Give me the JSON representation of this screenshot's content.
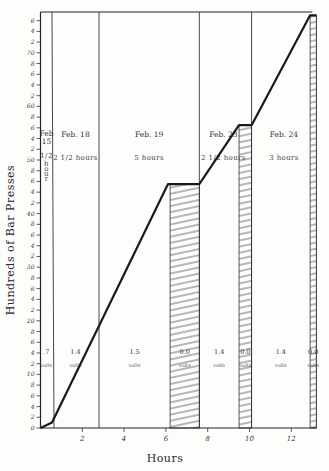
{
  "chart_data": {
    "type": "line",
    "title": "",
    "xlabel": "Hours",
    "ylabel": "Hundreds of Bar Presses",
    "xlim": [
      0,
      13.2
    ],
    "ylim": [
      0,
      78
    ],
    "x_ticks": [
      2,
      4,
      6,
      8,
      10,
      12
    ],
    "x_tick_labels": [
      "2",
      "4",
      "6",
      "8",
      "10",
      "12"
    ],
    "y_major_ticks": [
      0,
      10,
      20,
      30,
      40,
      50,
      60,
      70
    ],
    "y_major_labels": [
      "0",
      "10",
      "20",
      "30",
      "40",
      "50",
      "60",
      "70"
    ],
    "y_minor_step": 2,
    "y_minor_labels": [
      "2",
      "4",
      "6",
      "8"
    ],
    "grid": false,
    "series": [
      {
        "name": "Cumulative bar presses",
        "points": [
          [
            0,
            0
          ],
          [
            0.55,
            1
          ],
          [
            6.1,
            45.5
          ],
          [
            7.6,
            45.5
          ],
          [
            9.5,
            56.5
          ],
          [
            10.1,
            56.5
          ],
          [
            12.9,
            77
          ],
          [
            13.2,
            77
          ]
        ]
      }
    ],
    "sessions": [
      {
        "date": "Feb. 15",
        "duration": "1/2 hour",
        "start": 0,
        "end": 0.55
      },
      {
        "date": "Feb. 18",
        "duration": "2 1/2 hours",
        "start": 0.55,
        "end": 2.8
      },
      {
        "date": "Feb. 19",
        "duration": "5 hours",
        "start": 2.8,
        "end": 7.6
      },
      {
        "date": "Feb. 23",
        "duration": "2 1/2 hours",
        "start": 7.6,
        "end": 10.1
      },
      {
        "date": "Feb. 24",
        "duration": "3 hours",
        "start": 10.1,
        "end": 13.2
      }
    ],
    "voltage_segments": [
      {
        "value": ".7",
        "unit": "volts",
        "start": 0,
        "end": 0.55,
        "hatched": false
      },
      {
        "value": "1.4",
        "unit": "volts",
        "start": 0.55,
        "end": 2.8,
        "hatched": false
      },
      {
        "value": "1.5",
        "unit": "volts",
        "start": 2.8,
        "end": 6.2,
        "hatched": false
      },
      {
        "value": "0.0",
        "unit": "volts",
        "start": 6.2,
        "end": 7.6,
        "hatched": true
      },
      {
        "value": "1.4",
        "unit": "volts",
        "start": 7.6,
        "end": 9.5,
        "hatched": false
      },
      {
        "value": "0.0",
        "unit": "volts",
        "start": 9.5,
        "end": 10.1,
        "hatched": true
      },
      {
        "value": "1.4",
        "unit": "volts",
        "start": 10.1,
        "end": 12.9,
        "hatched": false
      },
      {
        "value": "0.0",
        "unit": "volts",
        "start": 12.9,
        "end": 13.2,
        "hatched": true
      }
    ],
    "session_dividers": [
      0.55,
      2.8,
      7.6,
      10.1
    ]
  }
}
